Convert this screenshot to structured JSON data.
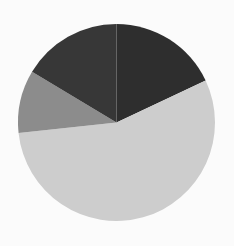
{
  "chart_data": {
    "type": "pie",
    "title": "",
    "legend": [],
    "start_angle_deg": 0,
    "direction": "clockwise",
    "center": [
      116.5,
      122.5
    ],
    "radius": 98.5,
    "slices": [
      {
        "name": "slice-1",
        "value": 18.0,
        "color": "#2e2e2e"
      },
      {
        "name": "slice-2",
        "value": 55.3,
        "color": "#cdcdcd"
      },
      {
        "name": "slice-3",
        "value": 10.3,
        "color": "#8c8c8c"
      },
      {
        "name": "slice-4",
        "value": 16.4,
        "color": "#373737"
      }
    ],
    "values": [
      18.0,
      55.3,
      10.3,
      16.4
    ],
    "categories": [
      "slice-1",
      "slice-2",
      "slice-3",
      "slice-4"
    ]
  },
  "background_color": "#fbfbfb"
}
